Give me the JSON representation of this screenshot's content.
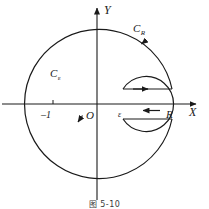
{
  "figure": {
    "caption": "图 5-10",
    "axes": {
      "y_label": "Y",
      "x_label": "X",
      "origin_label": "O"
    },
    "point_labels": {
      "minus_one": "–1",
      "epsilon": "ε",
      "radius": "R"
    },
    "curve_labels": {
      "outer": "C",
      "outer_sub": "R",
      "inner": "C",
      "inner_sub": "ε"
    },
    "colors": {
      "stroke": "#1a1a1a",
      "background": "#ffffff",
      "text": "#1a1a1a"
    }
  }
}
